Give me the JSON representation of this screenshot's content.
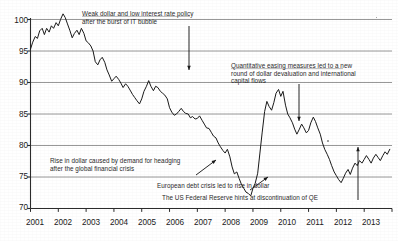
{
  "chart_data": {
    "type": "line",
    "title": "",
    "subtitle": "",
    "xlabel": "",
    "ylabel": "",
    "xlim": [
      2001,
      2014
    ],
    "ylim": [
      70,
      100
    ],
    "grid": true,
    "grid_axis": "y",
    "legend": "none",
    "xticklabels": [
      "2001",
      "2002",
      "2003",
      "2004",
      "2005",
      "2006",
      "2007",
      "2008",
      "2009",
      "2010",
      "2011",
      "2012",
      "2013"
    ],
    "yticklabels": [
      "70",
      "75",
      "80",
      "85",
      "90",
      "95",
      "100"
    ],
    "yticks": [
      70,
      75,
      80,
      85,
      90,
      95,
      100
    ],
    "series": [
      {
        "name": "Dollar index",
        "x": [
          2001.0,
          2001.08,
          2001.17,
          2001.25,
          2001.33,
          2001.42,
          2001.5,
          2001.58,
          2001.67,
          2001.75,
          2001.83,
          2001.92,
          2002.0,
          2002.08,
          2002.17,
          2002.25,
          2002.33,
          2002.42,
          2002.5,
          2002.58,
          2002.67,
          2002.75,
          2002.83,
          2002.92,
          2003.0,
          2003.08,
          2003.17,
          2003.25,
          2003.33,
          2003.42,
          2003.5,
          2003.58,
          2003.67,
          2003.75,
          2003.83,
          2003.92,
          2004.0,
          2004.08,
          2004.17,
          2004.25,
          2004.33,
          2004.42,
          2004.5,
          2004.58,
          2004.67,
          2004.75,
          2004.83,
          2004.92,
          2005.0,
          2005.08,
          2005.17,
          2005.25,
          2005.33,
          2005.42,
          2005.5,
          2005.58,
          2005.67,
          2005.75,
          2005.83,
          2005.92,
          2006.0,
          2006.08,
          2006.17,
          2006.25,
          2006.33,
          2006.42,
          2006.5,
          2006.58,
          2006.67,
          2006.75,
          2006.83,
          2006.92,
          2007.0,
          2007.08,
          2007.17,
          2007.25,
          2007.33,
          2007.42,
          2007.5,
          2007.58,
          2007.67,
          2007.75,
          2007.83,
          2007.92,
          2008.0,
          2008.08,
          2008.17,
          2008.25,
          2008.33,
          2008.42,
          2008.5,
          2008.58,
          2008.67,
          2008.75,
          2008.83,
          2008.92,
          2009.0,
          2009.08,
          2009.17,
          2009.25,
          2009.33,
          2009.42,
          2009.5,
          2009.58,
          2009.67,
          2009.75,
          2009.83,
          2009.92,
          2010.0,
          2010.08,
          2010.17,
          2010.25,
          2010.33,
          2010.42,
          2010.5,
          2010.58,
          2010.67,
          2010.75,
          2010.83,
          2010.92,
          2011.0,
          2011.08,
          2011.17,
          2011.25,
          2011.33,
          2011.42,
          2011.5,
          2011.58,
          2011.67,
          2011.75,
          2011.83,
          2011.92,
          2012.0,
          2012.08,
          2012.17,
          2012.25,
          2012.33,
          2012.42,
          2012.5,
          2012.58,
          2012.67,
          2012.75,
          2012.83,
          2012.92,
          2013.0,
          2013.08,
          2013.17,
          2013.25,
          2013.33,
          2013.42,
          2013.5,
          2013.58,
          2013.67,
          2013.75,
          2013.83,
          2013.92
        ],
        "y": [
          95.3,
          96.4,
          97.3,
          97.0,
          98.2,
          98.6,
          97.6,
          98.6,
          98.0,
          99.0,
          98.6,
          99.5,
          99.0,
          100.0,
          100.9,
          100.3,
          99.3,
          98.2,
          97.1,
          97.8,
          98.3,
          97.6,
          98.6,
          97.8,
          96.6,
          96.3,
          95.8,
          95.0,
          93.3,
          92.8,
          93.6,
          94.0,
          93.2,
          92.0,
          91.2,
          90.2,
          90.6,
          91.0,
          90.5,
          89.9,
          89.2,
          89.8,
          89.4,
          88.8,
          88.1,
          87.6,
          87.1,
          86.6,
          87.4,
          88.6,
          89.4,
          90.3,
          89.4,
          88.7,
          89.4,
          89.2,
          88.6,
          88.3,
          88.0,
          87.4,
          86.0,
          85.3,
          84.8,
          85.0,
          85.4,
          85.9,
          85.4,
          85.1,
          85.0,
          84.4,
          84.6,
          84.2,
          84.3,
          84.7,
          84.0,
          83.4,
          82.8,
          82.7,
          82.1,
          81.5,
          81.2,
          80.4,
          79.8,
          79.2,
          78.8,
          79.4,
          78.2,
          76.6,
          75.5,
          75.8,
          74.8,
          73.9,
          73.2,
          72.6,
          72.4,
          72.0,
          73.2,
          74.0,
          75.6,
          78.8,
          82.0,
          85.4,
          87.0,
          86.2,
          85.6,
          86.8,
          88.3,
          88.9,
          87.8,
          88.6,
          86.4,
          85.0,
          84.4,
          83.6,
          82.6,
          81.8,
          82.6,
          83.4,
          82.8,
          82.0,
          82.4,
          83.6,
          84.5,
          83.8,
          82.8,
          81.8,
          80.4,
          79.4,
          78.6,
          77.8,
          76.8,
          75.8,
          75.2,
          74.6,
          74.1,
          74.8,
          75.6,
          76.2,
          75.4,
          76.4,
          77.2,
          76.8,
          77.6,
          77.2,
          77.8,
          78.4,
          77.8,
          77.2,
          78.0,
          78.6,
          78.1,
          77.6,
          78.4,
          79.0,
          78.6,
          79.4
        ]
      }
    ],
    "annotations": [
      {
        "id": "annotation-it-bubble",
        "lines": [
          "Weak dollar and low interest rate policy",
          "after the burst of IT bubble"
        ],
        "arrow": "down"
      },
      {
        "id": "annotation-quantitative-easing",
        "lines": [
          "Quantitative easing measures led to a new",
          "round of dollar devaluation and international",
          "capital flows"
        ],
        "arrow": "down"
      },
      {
        "id": "annotation-hedging-demand",
        "lines": [
          "Rise in dollar caused by demand for headging",
          "after the global financial crisis"
        ],
        "arrow": "diagonal-up-right"
      },
      {
        "id": "annotation-european-debt-crisis",
        "lines": [
          "European debt crisis led to rise in dollar"
        ],
        "arrow": "diagonal-up-right"
      },
      {
        "id": "annotation-discontinuation-qe",
        "lines": [
          "The US Federal Reserve hints at discontinuation of QE"
        ],
        "arrow": "up"
      }
    ]
  },
  "axis": {
    "y_labels": [
      "100",
      "95",
      "90",
      "85",
      "80",
      "75",
      "70"
    ],
    "x_labels": [
      "2001",
      "2002",
      "2003",
      "2004",
      "2005",
      "2006",
      "2007",
      "2008",
      "2009",
      "2010",
      "2011",
      "2012",
      "2013"
    ]
  },
  "annotations_text": {
    "it_bubble_line1": "Weak dollar and low interest rate policy",
    "it_bubble_line2": "after the burst of IT bubble",
    "qe_line1": "Quantitative easing measures led to a new",
    "qe_line2": "round of dollar devaluation and international",
    "qe_line3": "capital flows",
    "hedging_line1": "Rise in dollar caused by demand for headging",
    "hedging_line2": "after the global financial crisis",
    "euro_debt_line1": "European debt crisis led to rise in dollar",
    "fed_qe_line1": "The US Federal Reserve hints at discontinuation of QE"
  },
  "colors": {
    "line": "#1a1a1a",
    "grid": "#8c8c8c",
    "axis": "#2b2b2b",
    "text": "#262626",
    "background": "#ffffff"
  }
}
